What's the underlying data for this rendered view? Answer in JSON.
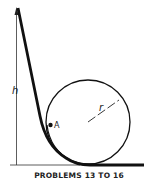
{
  "diagram": {
    "height_label": "h",
    "radius_label": "r",
    "point_label": "A",
    "caption": "PROBLEMS 13 TO 16",
    "stroke_color": "#111111"
  }
}
